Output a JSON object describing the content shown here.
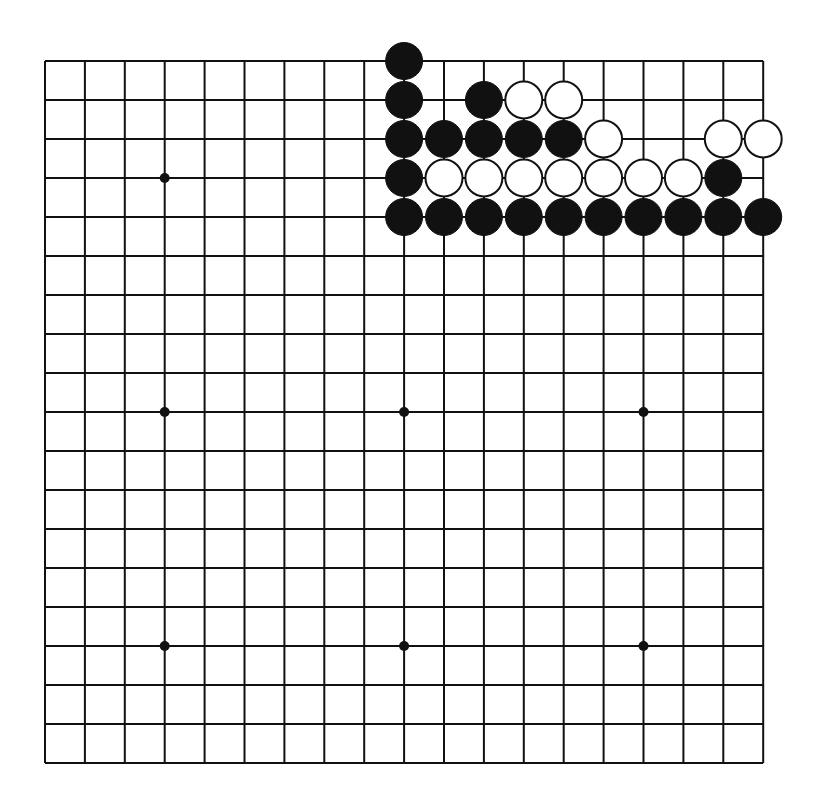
{
  "diagram": {
    "type": "go-board",
    "size": 19,
    "colors": {
      "line": "#111111",
      "black": "#111111",
      "white": "#ffffff",
      "background": "#ffffff"
    },
    "grid": {
      "x0": 45,
      "y0": 61,
      "spacing_x": 39.9,
      "spacing_y": 39.0
    },
    "star_points": [
      [
        3,
        3
      ],
      [
        9,
        3
      ],
      [
        15,
        3
      ],
      [
        3,
        9
      ],
      [
        9,
        9
      ],
      [
        15,
        9
      ],
      [
        3,
        15
      ],
      [
        9,
        15
      ],
      [
        15,
        15
      ]
    ],
    "stones": [
      {
        "col": 9,
        "row": 0,
        "color": "black"
      },
      {
        "col": 9,
        "row": 1,
        "color": "black"
      },
      {
        "col": 11,
        "row": 1,
        "color": "black"
      },
      {
        "col": 12,
        "row": 1,
        "color": "white"
      },
      {
        "col": 13,
        "row": 1,
        "color": "white"
      },
      {
        "col": 9,
        "row": 2,
        "color": "black"
      },
      {
        "col": 10,
        "row": 2,
        "color": "black"
      },
      {
        "col": 11,
        "row": 2,
        "color": "black"
      },
      {
        "col": 12,
        "row": 2,
        "color": "black"
      },
      {
        "col": 13,
        "row": 2,
        "color": "black"
      },
      {
        "col": 14,
        "row": 2,
        "color": "white"
      },
      {
        "col": 17,
        "row": 2,
        "color": "white"
      },
      {
        "col": 18,
        "row": 2,
        "color": "white"
      },
      {
        "col": 9,
        "row": 3,
        "color": "black"
      },
      {
        "col": 10,
        "row": 3,
        "color": "white"
      },
      {
        "col": 11,
        "row": 3,
        "color": "white"
      },
      {
        "col": 12,
        "row": 3,
        "color": "white"
      },
      {
        "col": 13,
        "row": 3,
        "color": "white"
      },
      {
        "col": 14,
        "row": 3,
        "color": "white"
      },
      {
        "col": 15,
        "row": 3,
        "color": "white"
      },
      {
        "col": 16,
        "row": 3,
        "color": "white"
      },
      {
        "col": 17,
        "row": 3,
        "color": "black"
      },
      {
        "col": 9,
        "row": 4,
        "color": "black"
      },
      {
        "col": 10,
        "row": 4,
        "color": "black"
      },
      {
        "col": 11,
        "row": 4,
        "color": "black"
      },
      {
        "col": 12,
        "row": 4,
        "color": "black"
      },
      {
        "col": 13,
        "row": 4,
        "color": "black"
      },
      {
        "col": 14,
        "row": 4,
        "color": "black"
      },
      {
        "col": 15,
        "row": 4,
        "color": "black"
      },
      {
        "col": 16,
        "row": 4,
        "color": "black"
      },
      {
        "col": 17,
        "row": 4,
        "color": "black"
      },
      {
        "col": 18,
        "row": 4,
        "color": "black"
      }
    ],
    "stone_counts": {
      "black": 21,
      "white": 11
    }
  }
}
